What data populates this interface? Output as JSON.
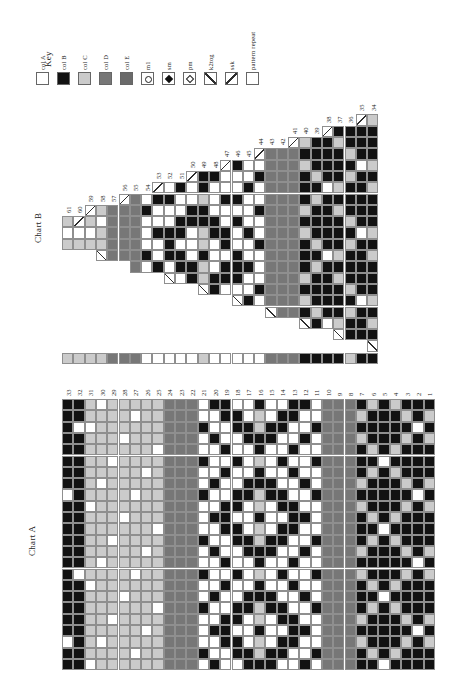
{
  "page": {
    "background": "#ffffff",
    "description": "knitting colorwork pattern page, rotated 90 degrees, with Key, Chart B (crown decrease triangle) and Chart A (main repeat)"
  },
  "colors": {
    "colA": "#ffffff",
    "colB": "#121212",
    "colC": "#cbcbcb",
    "colD": "#777777",
    "colE": "#6a6a6a",
    "grid_line": "#8f8f8f",
    "symbol_line": "#2e2e2e"
  },
  "cell_codes": {
    "A": "col A (white)",
    "B": "col B (black)",
    "C": "col C (light grey)",
    "D": "col D (grey)",
    ">": "decrease cell with rising slash (ssk)",
    "<": "decrease cell with falling slash (k2tog)"
  },
  "key": {
    "title": "Key",
    "items": [
      {
        "label": "col A",
        "type": "swatch",
        "color": "#ffffff"
      },
      {
        "label": "col B",
        "type": "swatch",
        "color": "#121212"
      },
      {
        "label": "col C",
        "type": "swatch",
        "color": "#cbcbcb"
      },
      {
        "label": "col D",
        "type": "swatch",
        "color": "#777777"
      },
      {
        "label": "col E",
        "type": "swatch",
        "color": "#6a6a6a"
      },
      {
        "label": "m1",
        "type": "symbol",
        "symbol": "m1-circle"
      },
      {
        "label": "sm",
        "type": "symbol",
        "symbol": "filled-diamond"
      },
      {
        "label": "pm",
        "type": "symbol",
        "symbol": "open-diamond"
      },
      {
        "label": "k2tog",
        "type": "symbol",
        "symbol": "backslash"
      },
      {
        "label": "ssk",
        "type": "symbol",
        "symbol": "forwardslash"
      },
      {
        "label": "pattern repeat",
        "type": "symbol",
        "symbol": "empty-square"
      }
    ]
  },
  "chartB": {
    "title": "Chart B",
    "row_numbers": [
      61,
      60,
      59,
      58,
      57,
      56,
      55,
      54,
      53,
      52,
      51,
      50,
      49,
      48,
      47,
      46,
      45,
      44,
      43,
      42,
      41,
      40,
      39,
      38,
      37,
      36,
      35,
      34
    ],
    "columns": [
      {
        "n": 61,
        "cells": "CAC",
        "drop": 0
      },
      {
        "n": 60,
        "cells": ">AC",
        "drop": 0
      },
      {
        "n": 59,
        "cells": ">CAC",
        "drop": 0
      },
      {
        "n": 58,
        "cells": "CACC<",
        "drop": 1
      },
      {
        "n": 57,
        "cells": "DDDDD",
        "drop": 1
      },
      {
        "n": 56,
        "cells": ">DDDDD",
        "drop": 1
      },
      {
        "n": 55,
        "cells": "DDDDDDD",
        "drop": 2
      },
      {
        "n": 54,
        "cells": "ABAAABA",
        "drop": 2
      },
      {
        "n": 53,
        "cells": ">BAABAAB",
        "drop": 2
      },
      {
        "n": 52,
        "cells": "ABAABBBA<",
        "drop": 3
      },
      {
        "n": 51,
        "cells": "BAABBABBA",
        "drop": 3
      },
      {
        "n": 50,
        "cells": ">AABBAAABB",
        "drop": 3
      },
      {
        "n": 49,
        "cells": "BBCBBCCBCC<",
        "drop": 4
      },
      {
        "n": 48,
        "cells": "BAAABBAAABB",
        "drop": 4
      },
      {
        "n": 47,
        "cells": ">AABAABBABBA",
        "drop": 4
      },
      {
        "n": 46,
        "cells": "BAABABAABBBA<",
        "drop": 5
      },
      {
        "n": 45,
        "cells": "AABAAABAABAAB",
        "drop": 5
      },
      {
        "n": 44,
        "cells": ">ABAABAABAAABA",
        "drop": 5
      },
      {
        "n": 43,
        "cells": "DDDDDDDDDDDDDD<",
        "drop": 6
      },
      {
        "n": 42,
        "cells": "DDDDDDDDDDDDDDD",
        "drop": 6
      },
      {
        "n": 41,
        "cells": ">DDDDDDDDDDDDDDD",
        "drop": 6
      },
      {
        "n": 40,
        "cells": "CBCBBBCBCBBBCBCB<",
        "drop": 7
      },
      {
        "n": 39,
        "cells": "BBBCBCBBBCBCBBBCB",
        "drop": 7
      },
      {
        "n": 38,
        "cells": ">BBBBABBBBBABBBBBA",
        "drop": 7
      },
      {
        "n": 37,
        "cells": "BCBBBCBCBBBCBCBBBC<",
        "drop": 8
      },
      {
        "n": 36,
        "cells": "BBCBCBBBCBCBBBCBCBB",
        "drop": 8
      },
      {
        "n": 35,
        "cells": ">BBBABBBBBABBBBBABBB",
        "drop": 8
      },
      {
        "n": 34,
        "cells": "CBBBCBCBBBCBCBBBCBCB<",
        "drop": 9
      }
    ]
  },
  "strip": {
    "cells": "CCCCDDDAAAAACAAAAADDDBBBBCBB"
  },
  "chartA": {
    "title": "Chart A",
    "row_numbers": [
      33,
      32,
      31,
      30,
      29,
      28,
      27,
      26,
      25,
      24,
      23,
      22,
      21,
      20,
      19,
      18,
      17,
      16,
      15,
      14,
      13,
      12,
      11,
      10,
      9,
      8,
      7,
      6,
      5,
      4,
      3,
      2,
      1
    ],
    "columns": [
      {
        "n": 33,
        "cells": "BBBBBBBBABBBBBBBBBBBBABB"
      },
      {
        "n": 32,
        "cells": "BBABBBBBBBBBBBBABBBBBBBB"
      },
      {
        "n": 31,
        "cells": "CCACCCCCCACCCCCCACCCCCCA"
      },
      {
        "n": 30,
        "cells": "ACCCCCCACCCCCCACCCCCCACC"
      },
      {
        "n": 29,
        "cells": "CCCCCACCCCCCACCCCCCACCCC"
      },
      {
        "n": 28,
        "cells": "CCCACCCCCCACCCCCCACCCCCC"
      },
      {
        "n": 27,
        "cells": "CACCCCCCACCCCCCACCCCCCAC"
      },
      {
        "n": 26,
        "cells": "CCCCCCACCCCCCACCCCCCACCC"
      },
      {
        "n": 25,
        "cells": "CCCCACCCCCCACCCCCCACCCCC"
      },
      {
        "n": 24,
        "cells": "DDDDDDDDDDDDDDDDDDDDDDDD"
      },
      {
        "n": 23,
        "cells": "DDDDDDDDDDDDDDDDDDDDDDDD"
      },
      {
        "n": 22,
        "cells": "DDDDDDDDDDDDDDDDDDDDDDDD"
      },
      {
        "n": 21,
        "cells": "AABAABAABAAABAABAABAAABA"
      },
      {
        "n": 20,
        "cells": "BAABAAABAABAABAAABAABAAB"
      },
      {
        "n": 19,
        "cells": "BBAABABAABBBAABABAABBBAA"
      },
      {
        "n": 18,
        "cells": "ABBAABAABBABBAABAABBABBA"
      },
      {
        "n": 17,
        "cells": "AABBAAABBAAABBAAABBAAABB"
      },
      {
        "n": 16,
        "cells": "BCCBBCBBCCBCCBBCBBCCBCCB"
      },
      {
        "n": 15,
        "cells": "AABBAAABBAAABBAAABBAAABB"
      },
      {
        "n": 14,
        "cells": "ABBAABAABBABBAABAABBABBA"
      },
      {
        "n": 13,
        "cells": "BBAABABAABBBAABABAABBBAA"
      },
      {
        "n": 12,
        "cells": "BAABAAABAABAABAAABAABAAB"
      },
      {
        "n": 11,
        "cells": "AABAABAABAAABAABAABAAABA"
      },
      {
        "n": 10,
        "cells": "DDDDDDDDDDDDDDDDDDDDDDDD"
      },
      {
        "n": 9,
        "cells": "DDDDDDDDDDDDDDDDDDDDDDDD"
      },
      {
        "n": 8,
        "cells": "DDDDDDDDDDDDDDDDDDDDDDDD"
      },
      {
        "n": 7,
        "cells": "BCBCBBBCBCBBBCBCBBBCBCBB"
      },
      {
        "n": 6,
        "cells": "CBBBCBCBBBCBCBBBCBCBBBCB"
      },
      {
        "n": 5,
        "cells": "BBBBBABBBBBABBBBBABBBBBA"
      },
      {
        "n": 4,
        "cells": "CBBBCBCBBBCBCBBBCBCBBBCB"
      },
      {
        "n": 3,
        "cells": "BCBCBBBCBCBBBCBCBBBCBCBB"
      },
      {
        "n": 2,
        "cells": "BBABBBBBABBBBBABBBBBABBB"
      },
      {
        "n": 1,
        "cells": "BCBCBBBCBCBBBCBCBBBCBCBB"
      }
    ]
  }
}
